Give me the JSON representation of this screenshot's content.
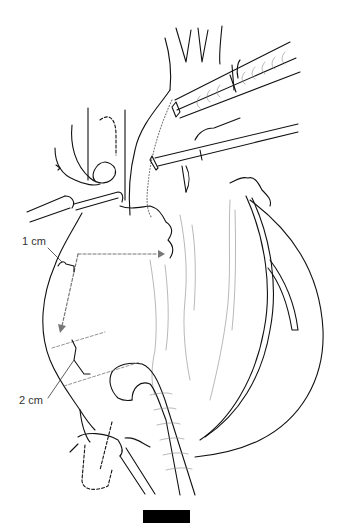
{
  "figure": {
    "type": "surgical line illustration",
    "labels": {
      "one_cm": "1 cm",
      "two_cm": "2 cm"
    },
    "scale_bar": {
      "color": "#000000"
    },
    "colors": {
      "ink": "#111111",
      "hatch": "#888888",
      "dashed_arrow": "#777777",
      "background": "#ffffff"
    }
  }
}
